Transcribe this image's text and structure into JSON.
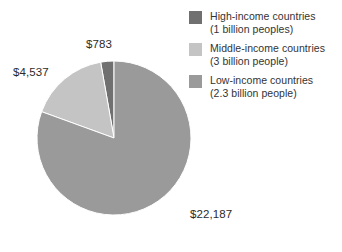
{
  "chart_data": {
    "type": "pie",
    "title": "",
    "subtitle": "",
    "xlabel": "",
    "ylabel": "",
    "grid": false,
    "legend_position": "top-right",
    "total": 27507,
    "categories": [
      "High-income countries",
      "Middle-income countries",
      "Low-income countries"
    ],
    "values": [
      783,
      4537,
      22187
    ],
    "value_labels": [
      "$783",
      "$4,537",
      "$22,187"
    ],
    "slices": [
      {
        "name": "High-income countries",
        "sublabel": "(1 billion peoples)",
        "value": 783,
        "value_label": "$783",
        "percent": 2.8,
        "start_angle": 350,
        "end_angle": 360,
        "color": "#707070"
      },
      {
        "name": "Middle-income countries",
        "sublabel": "(3 billion people)",
        "value": 4537,
        "value_label": "$4,537",
        "percent": 16.5,
        "start_angle": 290,
        "end_angle": 350,
        "color": "#c4c4c4"
      },
      {
        "name": "Low-income countries",
        "sublabel": "(2.3 billion people)",
        "value": 22187,
        "value_label": "$22,187",
        "percent": 80.7,
        "start_angle": 0,
        "end_angle": 290,
        "color": "#9a9a9a"
      }
    ]
  },
  "legend": {
    "items": [
      {
        "label": "High-income countries",
        "sublabel": "(1 billion peoples)",
        "color": "#707070"
      },
      {
        "label": "Middle-income countries",
        "sublabel": "(3 billion people)",
        "color": "#c4c4c4"
      },
      {
        "label": "Low-income countries",
        "sublabel": "(2.3 billion people)",
        "color": "#9a9a9a"
      }
    ]
  },
  "labels": {
    "high": "$783",
    "middle": "$4,537",
    "low": "$22,187"
  },
  "colors": {
    "high_income": "#707070",
    "middle_income": "#c4c4c4",
    "low_income": "#9a9a9a",
    "text": "#2b2b2b",
    "background": "#ffffff"
  }
}
